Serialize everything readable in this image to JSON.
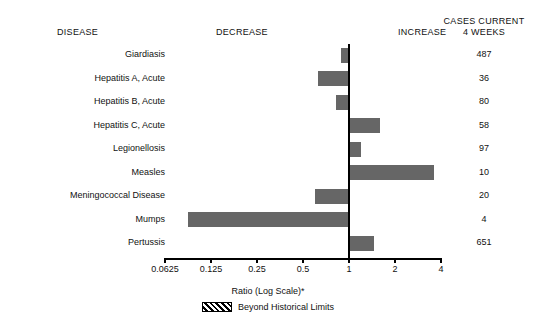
{
  "header": {
    "disease": "DISEASE",
    "decrease": "DECREASE",
    "increase": "INCREASE",
    "cases_line1": "CASES CURRENT",
    "cases_line2": "4 WEEKS"
  },
  "axis": {
    "title": "Ratio (Log Scale)*",
    "tick_labels": [
      "0.0625",
      "0.125",
      "0.25",
      "0.5",
      "1",
      "2",
      "4"
    ],
    "tick_values": [
      0.0625,
      0.125,
      0.25,
      0.5,
      1,
      2,
      4
    ]
  },
  "legend": {
    "swatch": "hatched-swatch",
    "label": "Beyond Historical Limits"
  },
  "colors": {
    "bar": "#666666",
    "axis": "#000000",
    "text": "#111111",
    "background": "#ffffff"
  },
  "chart_data": {
    "type": "bar",
    "title": "",
    "xlabel": "Ratio (Log Scale)*",
    "ylabel": "",
    "orientation": "horizontal",
    "scale": "log2",
    "baseline": 1,
    "xlim": [
      0.0625,
      4
    ],
    "grid": false,
    "legend_position": "bottom",
    "categories": [
      "Giardiasis",
      "Hepatitis A, Acute",
      "Hepatitis B, Acute",
      "Hepatitis C, Acute",
      "Legionellosis",
      "Measles",
      "Meningococcal Disease",
      "Mumps",
      "Pertussis"
    ],
    "values": [
      0.89,
      0.63,
      0.82,
      1.6,
      1.2,
      3.6,
      0.6,
      0.088,
      1.45
    ],
    "cases_current_4_weeks": [
      487,
      36,
      80,
      58,
      97,
      10,
      20,
      4,
      651
    ],
    "beyond_historical_limits": [
      false,
      false,
      false,
      false,
      false,
      false,
      false,
      false,
      false
    ],
    "series": [
      {
        "name": "Ratio to historical mean",
        "values": [
          0.89,
          0.63,
          0.82,
          1.6,
          1.2,
          3.6,
          0.6,
          0.088,
          1.45
        ]
      }
    ]
  }
}
